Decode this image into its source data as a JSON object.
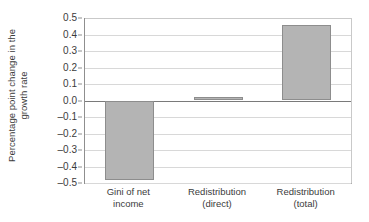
{
  "chart_data": {
    "type": "bar",
    "title": "",
    "subtitle": "",
    "xlabel": "",
    "ylabel": "Percentage point change in the growth rate",
    "ylabel_lines": [
      "Percentage point change in the",
      "growth rate"
    ],
    "categories": [
      "Gini of net income",
      "Redistribution (direct)",
      "Redistribution (total)"
    ],
    "category_lines": [
      [
        "Gini of net",
        "income"
      ],
      [
        "Redistribution",
        "(direct)"
      ],
      [
        "Redistribution",
        "(total)"
      ]
    ],
    "values": [
      -0.48,
      0.02,
      0.46
    ],
    "ylim": [
      -0.5,
      0.5
    ],
    "ytick_values": [
      0.5,
      0.4,
      0.3,
      0.2,
      0.1,
      0.0,
      -0.1,
      -0.2,
      -0.3,
      -0.4,
      -0.5
    ],
    "ytick_labels": [
      "0.5",
      "0.4",
      "0.3",
      "0.2",
      "0.1",
      "0.0",
      "–0.1",
      "–0.2",
      "–0.3",
      "–0.4",
      "–0.5"
    ],
    "grid": true,
    "legend": "none",
    "bar_fill_color": "#b4b4b4",
    "bar_border_color": "#8d8d8d",
    "gridline_color": "#d8d8d8",
    "zero_line_color": "#7a7a7a",
    "axis_color": "#8f8f8f",
    "text_color": "#3b3b3b",
    "background_color": "#ffffff"
  }
}
